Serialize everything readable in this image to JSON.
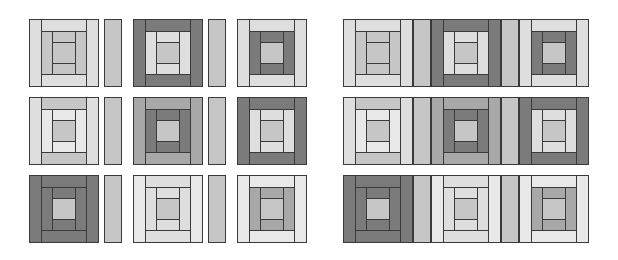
{
  "diagram": {
    "tones": {
      "D": "#7b7b7b",
      "M": "#a8a8a8",
      "L": "#c6c6c6",
      "V": "#dedede",
      "W": "#e8e8e8"
    },
    "left_panel": {
      "description": "Blocks separated by sashing strips with gaps",
      "rows": [
        {
          "y": 19,
          "blocks": [
            {
              "x": 29,
              "outer_sides": "V",
              "outer_tb": "V",
              "ring2_sides": "L",
              "ring2_tb": "L",
              "center": "L"
            },
            {
              "x": 133,
              "outer_sides": "D",
              "outer_tb": "D",
              "ring2_sides": "V",
              "ring2_tb": "V",
              "center": "L"
            },
            {
              "x": 237,
              "outer_sides": "V",
              "outer_tb": "V",
              "ring2_sides": "D",
              "ring2_tb": "D",
              "center": "L"
            }
          ],
          "sashes": [
            {
              "x": 104,
              "w": 18,
              "tone": "L"
            },
            {
              "x": 208,
              "w": 18,
              "tone": "L"
            }
          ]
        },
        {
          "y": 97,
          "blocks": [
            {
              "x": 29,
              "outer_sides": "V",
              "outer_tb": "L",
              "ring2_sides": "W",
              "ring2_tb": "W",
              "center": "L"
            },
            {
              "x": 133,
              "outer_sides": "M",
              "outer_tb": "M",
              "ring2_sides": "D",
              "ring2_tb": "D",
              "center": "L"
            },
            {
              "x": 237,
              "outer_sides": "D",
              "outer_tb": "D",
              "ring2_sides": "V",
              "ring2_tb": "V",
              "center": "L"
            }
          ],
          "sashes": [
            {
              "x": 104,
              "w": 18,
              "tone": "L"
            },
            {
              "x": 208,
              "w": 18,
              "tone": "L"
            }
          ]
        },
        {
          "y": 175,
          "blocks": [
            {
              "x": 29,
              "outer_sides": "D",
              "outer_tb": "D",
              "ring2_sides": "D",
              "ring2_tb": "D",
              "center": "L"
            },
            {
              "x": 133,
              "outer_sides": "W",
              "outer_tb": "V",
              "ring2_sides": "V",
              "ring2_tb": "V",
              "center": "L"
            },
            {
              "x": 237,
              "outer_sides": "W",
              "outer_tb": "W",
              "ring2_sides": "M",
              "ring2_tb": "M",
              "center": "L"
            }
          ],
          "sashes": [
            {
              "x": 104,
              "w": 18,
              "tone": "L"
            },
            {
              "x": 208,
              "w": 18,
              "tone": "L"
            }
          ]
        }
      ]
    },
    "right_panel": {
      "description": "Blocks joined directly to sashing strips with no gaps",
      "x": 343,
      "w": 246,
      "rows": [
        {
          "y": 19,
          "blocks": [
            {
              "x": 343,
              "outer_sides": "V",
              "outer_tb": "V",
              "ring2_sides": "L",
              "ring2_tb": "L",
              "center": "L"
            },
            {
              "x": 431,
              "outer_sides": "D",
              "outer_tb": "D",
              "ring2_sides": "V",
              "ring2_tb": "V",
              "center": "L"
            },
            {
              "x": 519,
              "outer_sides": "V",
              "outer_tb": "V",
              "ring2_sides": "D",
              "ring2_tb": "D",
              "center": "L"
            }
          ],
          "sashes": [
            {
              "x": 413,
              "w": 18,
              "tone": "L"
            },
            {
              "x": 501,
              "w": 18,
              "tone": "L"
            }
          ]
        },
        {
          "y": 97,
          "blocks": [
            {
              "x": 343,
              "outer_sides": "V",
              "outer_tb": "L",
              "ring2_sides": "W",
              "ring2_tb": "W",
              "center": "L"
            },
            {
              "x": 431,
              "outer_sides": "M",
              "outer_tb": "M",
              "ring2_sides": "D",
              "ring2_tb": "D",
              "center": "L"
            },
            {
              "x": 519,
              "outer_sides": "D",
              "outer_tb": "D",
              "ring2_sides": "V",
              "ring2_tb": "V",
              "center": "L"
            }
          ],
          "sashes": [
            {
              "x": 413,
              "w": 18,
              "tone": "L"
            },
            {
              "x": 501,
              "w": 18,
              "tone": "L"
            }
          ]
        },
        {
          "y": 175,
          "blocks": [
            {
              "x": 343,
              "outer_sides": "D",
              "outer_tb": "D",
              "ring2_sides": "D",
              "ring2_tb": "D",
              "center": "L"
            },
            {
              "x": 431,
              "outer_sides": "W",
              "outer_tb": "V",
              "ring2_sides": "V",
              "ring2_tb": "V",
              "center": "L"
            },
            {
              "x": 519,
              "outer_sides": "W",
              "outer_tb": "W",
              "ring2_sides": "M",
              "ring2_tb": "M",
              "center": "L"
            }
          ],
          "sashes": [
            {
              "x": 413,
              "w": 18,
              "tone": "L"
            },
            {
              "x": 501,
              "w": 18,
              "tone": "L"
            }
          ]
        }
      ]
    }
  }
}
